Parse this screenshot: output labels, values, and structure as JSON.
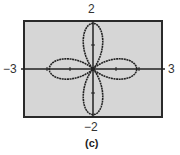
{
  "chart_data": {
    "type": "line",
    "subtype": "polar",
    "title": "",
    "caption": "(c)",
    "equation": "r = 2cos(2θ)",
    "xlim": [
      -3,
      3
    ],
    "ylim": [
      -2,
      2
    ],
    "xlabel": "",
    "ylabel": "",
    "x_tick_labels": [
      "−3",
      "3"
    ],
    "y_tick_labels": [
      "2",
      "−2"
    ],
    "x_ticks": [
      -2,
      -1,
      1,
      2
    ],
    "y_ticks": [
      -1,
      1
    ],
    "grid": false,
    "petal_tips": [
      [
        1.9,
        0
      ],
      [
        0,
        1.9
      ],
      [
        -1.9,
        0
      ],
      [
        0,
        -1.9
      ]
    ],
    "series": [
      {
        "name": "rose",
        "color": "#222222"
      }
    ]
  },
  "labels": {
    "xmin": "−3",
    "xmax": "3",
    "ymax": "2",
    "ymin": "−2",
    "caption": "(c)"
  },
  "colors": {
    "plot_bg": "#d6d6d6",
    "frame": "#2a2a2a",
    "curve": "#222222",
    "axis": "#222222"
  }
}
